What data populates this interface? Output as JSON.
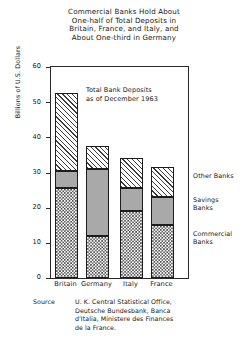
{
  "title": {
    "line1": "Commercial Banks Hold About",
    "line2": "One-half of Total Deposits in",
    "line3": "Britain, France, and Italy, and",
    "line4": "About One-third in Germany"
  },
  "annotation": {
    "line1": "Total Bank Deposits",
    "line2": "as of December 1963"
  },
  "legend": {
    "other": "Other Banks",
    "savings_line1": "Savings",
    "savings_line2": "Banks",
    "commercial_line1": "Commercial",
    "commercial_line2": "Banks"
  },
  "source": {
    "label": "Source",
    "line1": "U. K. Central Statistical Office,",
    "line2": "Deutsche Bundesbank, Banca",
    "line3": "d'Italia, Ministere des Finances",
    "line4": "de la France."
  },
  "colors": {
    "axis": "#2a2a2a",
    "text": "#161616",
    "savings_fill": "#9b9b9b",
    "commercial_fill": "#4a4a4a",
    "other_fill": "#3d3d3d"
  },
  "chart_data": {
    "type": "bar",
    "stacked": true,
    "title": "Commercial Banks Hold About One-half of Total Deposits in Britain, France, and Italy, and About One-third in Germany",
    "subtitle": "Total Bank Deposits as of December 1963",
    "xlabel": "",
    "ylabel": "Billions of U.S. Dollars",
    "categories": [
      "Britain",
      "Germany",
      "Italy",
      "France"
    ],
    "ylim": [
      0,
      60
    ],
    "yticks": [
      0,
      10,
      20,
      30,
      40,
      50,
      60
    ],
    "ytick_labels": [
      "0",
      "10",
      "20",
      "30",
      "40",
      "50",
      "60"
    ],
    "grid": false,
    "legend_position": "right",
    "series": [
      {
        "name": "Commercial Banks",
        "pattern": "checkerboard",
        "values": [
          25.5,
          12.0,
          19.0,
          15.0
        ]
      },
      {
        "name": "Savings Banks",
        "pattern": "solid-gray",
        "values": [
          5.0,
          19.0,
          6.5,
          8.0
        ]
      },
      {
        "name": "Other Banks",
        "pattern": "diagonal-hatch",
        "values": [
          22.0,
          6.5,
          8.5,
          8.5
        ]
      }
    ],
    "totals": [
      52.5,
      37.5,
      34.0,
      31.5
    ],
    "source": "Source: U. K. Central Statistical Office, Deutsche Bundesbank, Banca d'Italia, Ministere des Finances de la France."
  }
}
